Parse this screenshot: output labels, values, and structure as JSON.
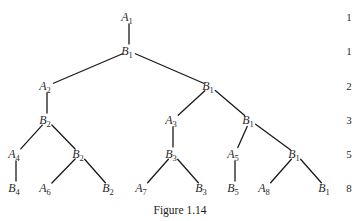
{
  "caption": "Figure 1.14",
  "row_counts": [
    {
      "y": 17,
      "value": "1"
    },
    {
      "y": 51,
      "value": "1"
    },
    {
      "y": 86,
      "value": "2"
    },
    {
      "y": 120,
      "value": "3"
    },
    {
      "y": 154,
      "value": "5"
    },
    {
      "y": 188,
      "value": "8"
    }
  ],
  "nodes": [
    {
      "id": "n1",
      "letter": "A",
      "sub": "1",
      "x": 129,
      "y": 17
    },
    {
      "id": "n2",
      "letter": "B",
      "sub": "1",
      "x": 129,
      "y": 51
    },
    {
      "id": "n3",
      "letter": "A",
      "sub": "2",
      "x": 47,
      "y": 86
    },
    {
      "id": "n4",
      "letter": "B",
      "sub": "1",
      "x": 210,
      "y": 86
    },
    {
      "id": "n5",
      "letter": "B",
      "sub": "2",
      "x": 47,
      "y": 120
    },
    {
      "id": "n6",
      "letter": "A",
      "sub": "3",
      "x": 173,
      "y": 120
    },
    {
      "id": "n7",
      "letter": "B",
      "sub": "1",
      "x": 250,
      "y": 120
    },
    {
      "id": "n8",
      "letter": "A",
      "sub": "4",
      "x": 16,
      "y": 154
    },
    {
      "id": "n9",
      "letter": "B",
      "sub": "2",
      "x": 80,
      "y": 154
    },
    {
      "id": "n10",
      "letter": "B",
      "sub": "3",
      "x": 173,
      "y": 154
    },
    {
      "id": "n11",
      "letter": "A",
      "sub": "5",
      "x": 235,
      "y": 154
    },
    {
      "id": "n12",
      "letter": "B",
      "sub": "1",
      "x": 296,
      "y": 154
    },
    {
      "id": "n13",
      "letter": "B",
      "sub": "4",
      "x": 16,
      "y": 188
    },
    {
      "id": "n14",
      "letter": "A",
      "sub": "6",
      "x": 47,
      "y": 188
    },
    {
      "id": "n15",
      "letter": "B",
      "sub": "2",
      "x": 110,
      "y": 188
    },
    {
      "id": "n16",
      "letter": "A",
      "sub": "7",
      "x": 143,
      "y": 188
    },
    {
      "id": "n17",
      "letter": "B",
      "sub": "3",
      "x": 203,
      "y": 188
    },
    {
      "id": "n18",
      "letter": "B",
      "sub": "5",
      "x": 235,
      "y": 188
    },
    {
      "id": "n19",
      "letter": "A",
      "sub": "8",
      "x": 266,
      "y": 188
    },
    {
      "id": "n20",
      "letter": "B",
      "sub": "1",
      "x": 326,
      "y": 188
    }
  ],
  "edges": [
    [
      "n1",
      "n2"
    ],
    [
      "n2",
      "n3"
    ],
    [
      "n2",
      "n4"
    ],
    [
      "n3",
      "n5"
    ],
    [
      "n4",
      "n6"
    ],
    [
      "n4",
      "n7"
    ],
    [
      "n5",
      "n8"
    ],
    [
      "n5",
      "n9"
    ],
    [
      "n6",
      "n10"
    ],
    [
      "n7",
      "n11"
    ],
    [
      "n7",
      "n12"
    ],
    [
      "n8",
      "n13"
    ],
    [
      "n9",
      "n14"
    ],
    [
      "n9",
      "n15"
    ],
    [
      "n10",
      "n16"
    ],
    [
      "n10",
      "n17"
    ],
    [
      "n11",
      "n18"
    ],
    [
      "n12",
      "n19"
    ],
    [
      "n12",
      "n20"
    ]
  ]
}
